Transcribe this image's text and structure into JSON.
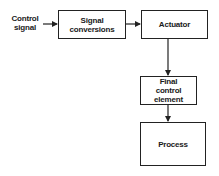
{
  "diagram": {
    "type": "block-diagram",
    "input_label": "Control\nsignal",
    "blocks": [
      {
        "id": "signal-conversions",
        "label": "Signal\nconversions"
      },
      {
        "id": "actuator",
        "label": "Actuator"
      },
      {
        "id": "final-control-element",
        "label": "Final\ncontrol\nelement"
      },
      {
        "id": "process",
        "label": "Process"
      }
    ],
    "edges": [
      {
        "from": "control-signal",
        "to": "signal-conversions"
      },
      {
        "from": "signal-conversions",
        "to": "actuator"
      },
      {
        "from": "actuator",
        "to": "final-control-element"
      },
      {
        "from": "final-control-element",
        "to": "process"
      }
    ],
    "colors": {
      "line": "#222222",
      "background": "#ffffff"
    }
  }
}
